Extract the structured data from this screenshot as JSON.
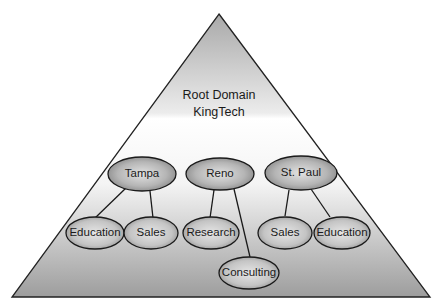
{
  "diagram": {
    "type": "domain-tree-pyramid",
    "root": {
      "line1": "Root Domain",
      "line2": "KingTech"
    },
    "sites": [
      {
        "name": "Tampa",
        "children": [
          "Education",
          "Sales"
        ]
      },
      {
        "name": "Reno",
        "children": [
          "Research",
          "Consulting"
        ]
      },
      {
        "name": "St. Paul",
        "children": [
          "Sales",
          "Education"
        ]
      }
    ],
    "labels": {
      "tampa": "Tampa",
      "tampa_education": "Education",
      "tampa_sales": "Sales",
      "reno": "Reno",
      "reno_research": "Research",
      "reno_consulting": "Consulting",
      "stpaul": "St. Paul",
      "stpaul_sales": "Sales",
      "stpaul_education": "Education"
    }
  }
}
